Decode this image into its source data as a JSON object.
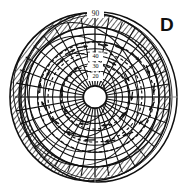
{
  "figure": {
    "panel_label": "D",
    "type": "polar-stereographic-projection",
    "background_color": "#ffffff",
    "ink_color": "#101010",
    "axis_color": "#8d8d8d",
    "hatch_color": "#151515"
  },
  "chart_data": {
    "type": "scatter",
    "title": "",
    "subtitle": "",
    "xlabel": "",
    "ylabel": "",
    "projection": "polar",
    "grid": true,
    "legend": null,
    "latitude_labels": [
      "90",
      "40",
      "30",
      "20"
    ],
    "latitude_label_values": [
      90,
      40,
      30,
      20
    ],
    "latitude_label_radii_px": [
      74,
      40,
      30,
      20
    ],
    "latitude_circles_px": [
      12,
      20,
      27.5,
      35,
      42.5,
      50,
      57.5,
      65,
      72,
      78
    ],
    "pole_hole_radius_px": 12,
    "meridian_count": 36,
    "hatch_band_inner_px": 66,
    "hatch_band_outer_px": 78,
    "center": {
      "x": 95,
      "y": 97
    },
    "outer_boundary": {
      "cx": 98,
      "cy": 97,
      "rx": 80,
      "ry": 86
    },
    "inner_boundary": {
      "cx": 90,
      "cy": 97,
      "rx": 74,
      "ry": 80
    },
    "annotations": [
      {
        "label": "90",
        "x": 95,
        "y": 14
      },
      {
        "label": "40",
        "x": 95,
        "y": 57
      },
      {
        "label": "30",
        "x": 95,
        "y": 67
      },
      {
        "label": "20",
        "x": 95,
        "y": 77
      }
    ],
    "arrow_vectors": [
      {
        "x": 70,
        "y": 52,
        "angle": -28,
        "len": 11
      },
      {
        "x": 82,
        "y": 47,
        "angle": -8,
        "len": 11
      },
      {
        "x": 60,
        "y": 62,
        "angle": -40,
        "len": 10
      },
      {
        "x": 47,
        "y": 76,
        "angle": -60,
        "len": 10
      },
      {
        "x": 40,
        "y": 88,
        "angle": -86,
        "len": 10
      },
      {
        "x": 44,
        "y": 106,
        "angle": -118,
        "len": 10
      },
      {
        "x": 55,
        "y": 121,
        "angle": -145,
        "len": 10
      },
      {
        "x": 71,
        "y": 133,
        "angle": -168,
        "len": 10
      },
      {
        "x": 90,
        "y": 140,
        "angle": 178,
        "len": 11
      },
      {
        "x": 110,
        "y": 141,
        "angle": 172,
        "len": 11
      },
      {
        "x": 128,
        "y": 134,
        "angle": 160,
        "len": 11
      },
      {
        "x": 143,
        "y": 121,
        "angle": 142,
        "len": 10
      },
      {
        "x": 152,
        "y": 106,
        "angle": 120,
        "len": 10
      },
      {
        "x": 154,
        "y": 88,
        "angle": 96,
        "len": 10
      },
      {
        "x": 148,
        "y": 70,
        "angle": 70,
        "len": 10
      },
      {
        "x": 136,
        "y": 57,
        "angle": 46,
        "len": 10
      },
      {
        "x": 120,
        "y": 48,
        "angle": 22,
        "len": 10
      },
      {
        "x": 103,
        "y": 45,
        "angle": 4,
        "len": 10
      },
      {
        "x": 62,
        "y": 92,
        "angle": -95,
        "len": 9
      },
      {
        "x": 67,
        "y": 112,
        "angle": -135,
        "len": 9
      },
      {
        "x": 84,
        "y": 124,
        "angle": -175,
        "len": 9
      },
      {
        "x": 106,
        "y": 125,
        "angle": 170,
        "len": 9
      },
      {
        "x": 124,
        "y": 114,
        "angle": 138,
        "len": 9
      },
      {
        "x": 132,
        "y": 96,
        "angle": 98,
        "len": 9
      },
      {
        "x": 127,
        "y": 77,
        "angle": 62,
        "len": 9
      },
      {
        "x": 112,
        "y": 63,
        "angle": 28,
        "len": 9
      },
      {
        "x": 92,
        "y": 60,
        "angle": 0,
        "len": 9
      },
      {
        "x": 74,
        "y": 70,
        "angle": -40,
        "len": 9
      }
    ],
    "dashed_contours": [
      {
        "cx": 95,
        "cy": 97,
        "rx": 34,
        "ry": 32,
        "rot": -12
      },
      {
        "cx": 95,
        "cy": 97,
        "rx": 47,
        "ry": 45,
        "rot": -8
      },
      {
        "cx": 96,
        "cy": 97,
        "rx": 58,
        "ry": 55,
        "rot": -5
      }
    ]
  }
}
